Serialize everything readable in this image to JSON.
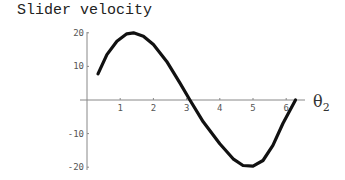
{
  "chart_data": {
    "type": "line",
    "title": "Slider velocity",
    "xlabel": "θ2",
    "ylabel": "",
    "xlim": [
      0,
      6.5
    ],
    "ylim": [
      -20,
      20
    ],
    "x_ticks": [
      1,
      2,
      3,
      4,
      5,
      6
    ],
    "y_ticks": [
      20,
      10,
      -10,
      -20
    ],
    "grid": false,
    "legend": null,
    "series": [
      {
        "name": "Slider velocity",
        "x": [
          0.33,
          0.6,
          0.9,
          1.2,
          1.4,
          1.7,
          2.0,
          2.4,
          2.8,
          3.1,
          3.5,
          4.0,
          4.4,
          4.7,
          5.0,
          5.3,
          5.6,
          5.9,
          6.28
        ],
        "y": [
          7.8,
          13.5,
          17.5,
          19.7,
          20.0,
          19.0,
          16.5,
          11.5,
          5.0,
          0.0,
          -6.5,
          -13.0,
          -17.5,
          -19.5,
          -19.7,
          -18.0,
          -13.5,
          -7.0,
          0.0
        ]
      }
    ]
  },
  "labels": {
    "title": "Slider velocity",
    "x_axis_main": "θ",
    "x_axis_sub": "2",
    "x_ticks": [
      "1",
      "2",
      "3",
      "4",
      "5",
      "6"
    ],
    "y_ticks": [
      "20",
      "10",
      "-10",
      "-20"
    ]
  }
}
